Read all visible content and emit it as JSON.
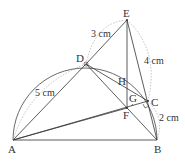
{
  "diagram": {
    "points": {
      "A": {
        "label": "A",
        "x": 13,
        "y": 140
      },
      "B": {
        "label": "B",
        "x": 157,
        "y": 140
      },
      "C": {
        "label": "C",
        "x": 148,
        "y": 101
      },
      "D": {
        "label": "D",
        "x": 86,
        "y": 64
      },
      "E": {
        "label": "E",
        "x": 127,
        "y": 20
      },
      "F": {
        "label": "F",
        "x": 127,
        "y": 108
      },
      "G": {
        "label": "G",
        "x": 127,
        "y": 100
      },
      "H": {
        "label": "H",
        "x": 127,
        "y": 86
      }
    },
    "measurements": {
      "AD": "5 cm",
      "DE": "3 cm",
      "EC": "4 cm",
      "CB": "2 cm"
    }
  }
}
